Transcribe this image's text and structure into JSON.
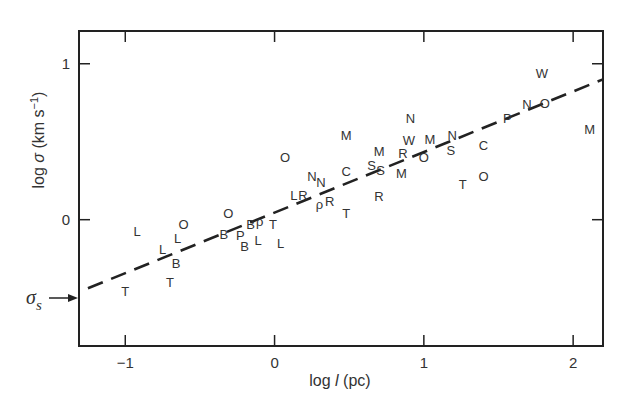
{
  "chart_data": {
    "type": "scatter",
    "title": "",
    "xlabel": "log l (pc)",
    "ylabel": "log σ (km s⁻¹)",
    "xlim": [
      -1.31,
      2.2
    ],
    "ylim": [
      -0.81,
      1.21
    ],
    "xticks": [
      -1,
      0,
      1,
      2
    ],
    "yticks": [
      0,
      1
    ],
    "grid": false,
    "legend": null,
    "annotation": {
      "text": "σs",
      "y": -0.5,
      "type": "arrow-to-axis"
    },
    "fit_line": {
      "style": "dashed",
      "x": [
        -1.25,
        2.2
      ],
      "y": [
        -0.44,
        0.9
      ]
    },
    "points": [
      {
        "label": "L",
        "x": -0.92,
        "y": -0.07
      },
      {
        "label": "O",
        "x": -0.61,
        "y": -0.03
      },
      {
        "label": "L",
        "x": -0.65,
        "y": -0.12
      },
      {
        "label": "L",
        "x": -0.75,
        "y": -0.19
      },
      {
        "label": "B",
        "x": -0.66,
        "y": -0.28
      },
      {
        "label": "T",
        "x": -1.0,
        "y": -0.46
      },
      {
        "label": "T",
        "x": -0.7,
        "y": -0.4
      },
      {
        "label": "O",
        "x": -0.31,
        "y": 0.04
      },
      {
        "label": "B",
        "x": -0.34,
        "y": -0.09
      },
      {
        "label": "P",
        "x": -0.23,
        "y": -0.1
      },
      {
        "label": "B",
        "x": -0.2,
        "y": -0.17
      },
      {
        "label": "B",
        "x": -0.16,
        "y": -0.03
      },
      {
        "label": "ρ",
        "x": -0.1,
        "y": -0.01
      },
      {
        "label": "T",
        "x": -0.01,
        "y": -0.03
      },
      {
        "label": "L",
        "x": -0.11,
        "y": -0.13
      },
      {
        "label": "L",
        "x": 0.04,
        "y": -0.15
      },
      {
        "label": "O",
        "x": 0.07,
        "y": 0.4
      },
      {
        "label": "L",
        "x": 0.13,
        "y": 0.16
      },
      {
        "label": "R",
        "x": 0.19,
        "y": 0.16
      },
      {
        "label": "N",
        "x": 0.25,
        "y": 0.28
      },
      {
        "label": "N",
        "x": 0.31,
        "y": 0.24
      },
      {
        "label": "ρ",
        "x": 0.3,
        "y": 0.1
      },
      {
        "label": "R",
        "x": 0.37,
        "y": 0.12
      },
      {
        "label": "T",
        "x": 0.48,
        "y": 0.04
      },
      {
        "label": "C",
        "x": 0.48,
        "y": 0.31
      },
      {
        "label": "M",
        "x": 0.48,
        "y": 0.54
      },
      {
        "label": "S",
        "x": 0.65,
        "y": 0.35
      },
      {
        "label": "S",
        "x": 0.71,
        "y": 0.32
      },
      {
        "label": "M",
        "x": 0.7,
        "y": 0.44
      },
      {
        "label": "R",
        "x": 0.7,
        "y": 0.15
      },
      {
        "label": "M",
        "x": 0.85,
        "y": 0.3
      },
      {
        "label": "R",
        "x": 0.86,
        "y": 0.43
      },
      {
        "label": "W",
        "x": 0.9,
        "y": 0.51
      },
      {
        "label": "N",
        "x": 0.91,
        "y": 0.65
      },
      {
        "label": "O",
        "x": 1.0,
        "y": 0.4
      },
      {
        "label": "M",
        "x": 1.04,
        "y": 0.52
      },
      {
        "label": "N",
        "x": 1.19,
        "y": 0.54
      },
      {
        "label": "S",
        "x": 1.18,
        "y": 0.45
      },
      {
        "label": "T",
        "x": 1.26,
        "y": 0.23
      },
      {
        "label": "O",
        "x": 1.4,
        "y": 0.28
      },
      {
        "label": "C",
        "x": 1.4,
        "y": 0.48
      },
      {
        "label": "P",
        "x": 1.56,
        "y": 0.65
      },
      {
        "label": "N",
        "x": 1.69,
        "y": 0.74
      },
      {
        "label": "O",
        "x": 1.81,
        "y": 0.75
      },
      {
        "label": "W",
        "x": 1.79,
        "y": 0.94
      },
      {
        "label": "M",
        "x": 2.11,
        "y": 0.58
      }
    ]
  },
  "axes": {
    "x_label_main": "log ",
    "x_label_var": "l",
    "x_label_unit": "  (pc)",
    "y_label_main": "log ",
    "y_label_var": "σ",
    "y_label_unit": " (km s",
    "y_label_sup": "−1",
    "y_label_close": ")",
    "sigma_s_main": "σ",
    "sigma_s_sub": "s"
  },
  "colors": {
    "ink": "#222222",
    "text": "#333333",
    "background": "#ffffff"
  }
}
